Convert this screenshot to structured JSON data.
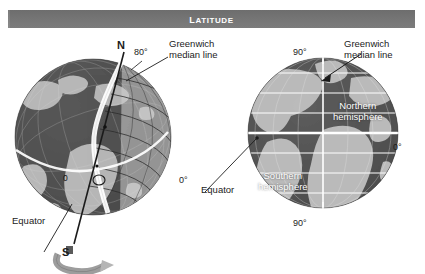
{
  "banner": {
    "title": "Latitude",
    "bg_color": "#7c7c7c",
    "text_color": "#ffffff"
  },
  "left_globe": {
    "name": "tilted-globe-with-latitude-rings",
    "labels": {
      "north_pole": "N",
      "south_pole": "S",
      "latitude_80": "80°",
      "equator_zero": "0",
      "right_zero": "0°",
      "equator": "Equator",
      "greenwich": "Greenwich\nmedian line"
    }
  },
  "right_globe": {
    "name": "front-facing-globe-hemispheres",
    "labels": {
      "top_90": "90°",
      "bottom_90": "90°",
      "right_zero": "0°",
      "greenwich": "Greenwich\nmedian line",
      "northern": "Northern\nhemisphere",
      "southern": "Southern\nhemisphere",
      "equator": "Equator"
    }
  },
  "colors": {
    "ocean_dark": "#4a4a4a",
    "land_light": "#b9b9b9",
    "grid_line": "#ffffff",
    "label_text": "#1b1b1b",
    "banner_bg": "#7c7c7c"
  }
}
